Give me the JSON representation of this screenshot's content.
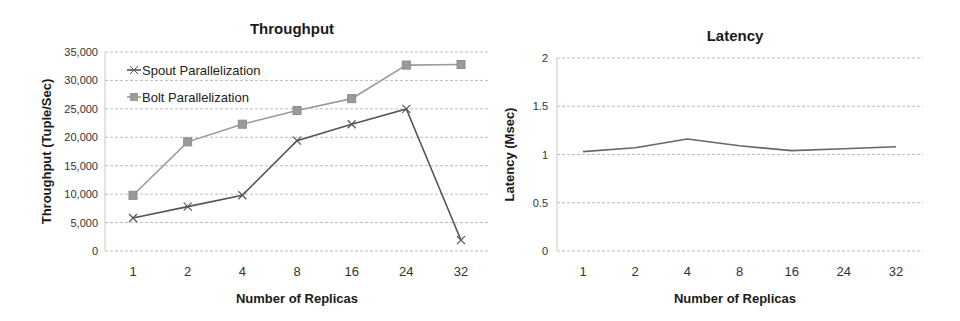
{
  "chart_data": [
    {
      "type": "line",
      "title": "Throughput",
      "xlabel": "Number of Replicas",
      "ylabel": "Throughput (Tuple/Sec)",
      "categories": [
        "1",
        "2",
        "4",
        "8",
        "16",
        "24",
        "32"
      ],
      "yticks": [
        "0",
        "5,000",
        "10,000",
        "15,000",
        "20,000",
        "25,000",
        "30,000",
        "35,000"
      ],
      "ylim": [
        0,
        35000
      ],
      "grid": true,
      "legend_position": "top-left inside",
      "series": [
        {
          "name": "Spout Parallelization",
          "marker": "x",
          "color": "#555555",
          "values": [
            5800,
            7800,
            9800,
            19400,
            22300,
            25000,
            1900
          ]
        },
        {
          "name": "Bolt Parallelization",
          "marker": "square",
          "color": "#9a9a9a",
          "values": [
            9800,
            19200,
            22300,
            24700,
            26800,
            32700,
            32800
          ]
        }
      ]
    },
    {
      "type": "line",
      "title": "Latency",
      "xlabel": "Number of Replicas",
      "ylabel": "Latency (Msec)",
      "categories": [
        "1",
        "2",
        "4",
        "8",
        "16",
        "24",
        "32"
      ],
      "yticks": [
        "0",
        "0.5",
        "1",
        "1.5",
        "2"
      ],
      "ylim": [
        0,
        2
      ],
      "grid": true,
      "series": [
        {
          "name": "Latency",
          "marker": "none",
          "color": "#666666",
          "values": [
            1.03,
            1.07,
            1.16,
            1.09,
            1.04,
            1.06,
            1.08
          ]
        }
      ]
    }
  ]
}
